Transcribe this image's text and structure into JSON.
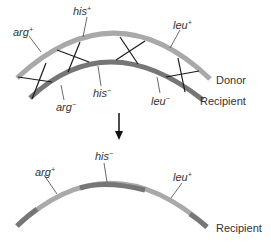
{
  "diagram": {
    "type": "genetic-recombination",
    "colors": {
      "donor": "#a9a9a9",
      "recipient": "#767676",
      "crossover": "#1a1a1a",
      "leader": "#444444",
      "text": "#333333",
      "arrow": "#111111"
    },
    "top": {
      "donor_label": "Donor",
      "recipient_label": "Recipient",
      "donor_genes": [
        {
          "name": "arg",
          "allele": "+"
        },
        {
          "name": "his",
          "allele": "+"
        },
        {
          "name": "leu",
          "allele": "+"
        }
      ],
      "recipient_genes": [
        {
          "name": "arg",
          "allele": "−"
        },
        {
          "name": "his",
          "allele": "−"
        },
        {
          "name": "leu",
          "allele": "−"
        }
      ],
      "crossover_count": 4
    },
    "bottom": {
      "recipient_label": "Recipient",
      "genes": [
        {
          "name": "arg",
          "allele": "+"
        },
        {
          "name": "his",
          "allele": "−"
        },
        {
          "name": "leu",
          "allele": "+"
        }
      ]
    }
  }
}
